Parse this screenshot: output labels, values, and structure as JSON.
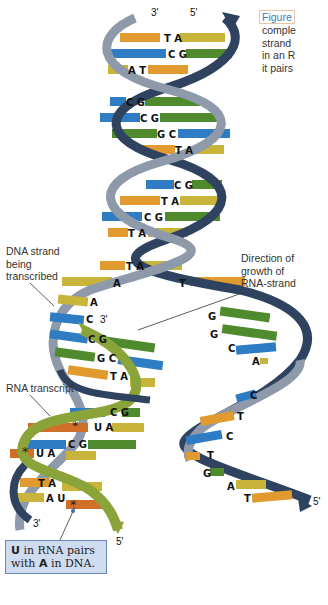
{
  "caption": {
    "figure_label": "Figure",
    "lines": [
      "comple",
      "strand",
      "in an R",
      "it pairs"
    ]
  },
  "labels": {
    "dna_strand": [
      "DNA strand",
      "being",
      "transcribed"
    ],
    "direction": [
      "Direction of",
      "growth of",
      "RNA-strand"
    ],
    "rna_transcript": "RNA transcript",
    "note_bold_u": "U",
    "note_text1": " in RNA pairs",
    "note_text2": "with ",
    "note_bold_a": "A",
    "note_text3": " in DNA."
  },
  "ends": {
    "top_left": "3'",
    "top_right": "5'",
    "rna_top": "3'",
    "bottom_left": "3'",
    "rna_bottom": "5'",
    "right_bottom": "5'"
  },
  "colors": {
    "backbone_light": "#8e9aaa",
    "backbone_dark": "#2f4360",
    "rna_backbone": "#8aa43a",
    "base_A": "#c8b43a",
    "base_T": "#e09a30",
    "base_C": "#2e7cc4",
    "base_G": "#4f8a2c",
    "base_U": "#cf6f2a",
    "note_bg": "#cfdcef"
  },
  "base_pairs": [
    {
      "left": "T",
      "right": "A",
      "y": 40
    },
    {
      "left": "C",
      "right": "G",
      "y": 56
    },
    {
      "left": "A",
      "right": "T",
      "y": 72
    },
    {
      "left": "C",
      "right": "G",
      "y": 104
    },
    {
      "left": "C",
      "right": "G",
      "y": 120
    },
    {
      "left": "G",
      "right": "C",
      "y": 136
    },
    {
      "left": "T",
      "right": "A",
      "y": 152
    },
    {
      "left": "C",
      "right": "G",
      "y": 187
    },
    {
      "left": "T",
      "right": "A",
      "y": 203
    },
    {
      "left": "C",
      "right": "G",
      "y": 219
    },
    {
      "left": "T",
      "right": "A",
      "y": 235
    },
    {
      "left": "T",
      "right": "A",
      "y": 268
    }
  ],
  "unwound": {
    "template": [
      "A",
      "A",
      "C"
    ],
    "coding": [
      "T",
      "G",
      "G",
      "C",
      "A",
      "C",
      "T",
      "C",
      "T",
      "G",
      "A",
      "T"
    ]
  },
  "hybrid_pairs": [
    {
      "dna": "C",
      "rna": "G"
    },
    {
      "dna": "G",
      "rna": "C"
    },
    {
      "dna": "T",
      "rna": "A"
    },
    {
      "dna": "C",
      "rna": "G"
    },
    {
      "dna": "U",
      "rna": "A",
      "star": true
    },
    {
      "dna": "C",
      "rna": "G"
    },
    {
      "dna": "U",
      "rna": "A",
      "star": true
    },
    {
      "dna": "T",
      "rna": "A"
    },
    {
      "dna": "A",
      "rna": "U",
      "star": true
    }
  ]
}
